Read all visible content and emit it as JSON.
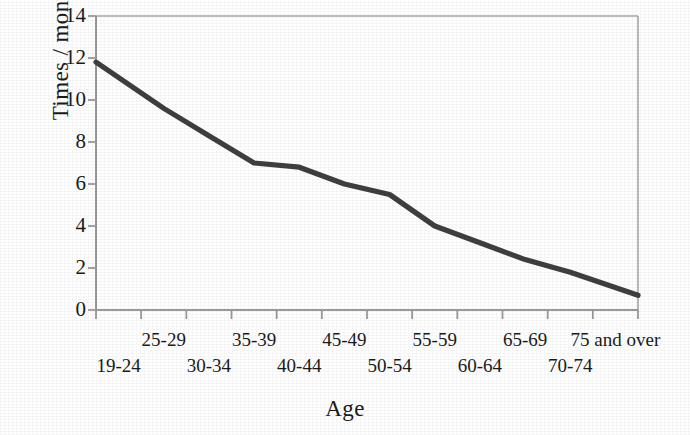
{
  "chart_data": {
    "type": "line",
    "title": "",
    "xlabel": "Age",
    "ylabel": "Times / month",
    "categories": [
      "19-24",
      "25-29",
      "30-34",
      "35-39",
      "40-44",
      "45-49",
      "50-54",
      "55-59",
      "60-64",
      "65-69",
      "70-74",
      "75 and over"
    ],
    "values": [
      11.8,
      9.6,
      8.3,
      7.0,
      6.8,
      6.0,
      5.5,
      4.0,
      3.2,
      2.4,
      1.8,
      0.7
    ],
    "series": [
      {
        "name": "Times / month",
        "values": [
          11.8,
          9.6,
          8.3,
          7.0,
          6.8,
          6.0,
          5.5,
          4.0,
          3.2,
          2.4,
          1.8,
          0.7
        ]
      }
    ],
    "ylim": [
      0,
      14
    ],
    "yticks": [
      "0",
      "2",
      "4",
      "6",
      "8",
      "10",
      "12",
      "14"
    ],
    "ytick_values": [
      0,
      2,
      4,
      6,
      8,
      10,
      12,
      14
    ],
    "xlim_note": "categorical, 12 bins with boundary ticks",
    "grid": false,
    "legend": false,
    "legend_position": "none",
    "line_color": "#3f3f3f",
    "axis_color": "#9a9a9a",
    "background_color": "#ffffff"
  },
  "axes": {
    "y_axis_label": "Times / month",
    "x_axis_label": "Age"
  },
  "x_labels_top_row": [
    "25-29",
    "35-39",
    "45-49",
    "55-59",
    "65-69",
    "75 and over"
  ],
  "x_labels_bottom_row": [
    "19-24",
    "30-34",
    "40-44",
    "50-54",
    "60-64",
    "70-74"
  ]
}
